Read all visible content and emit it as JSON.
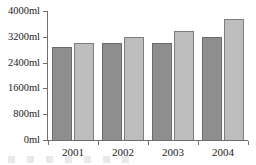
{
  "chart_data": {
    "type": "bar",
    "title": "",
    "subtitle": "",
    "xlabel": "",
    "ylabel": "",
    "categories": [
      "2001",
      "2002",
      "2003",
      "2004"
    ],
    "series": [
      {
        "name": "series-1",
        "color": "#8e8e8e",
        "values": [
          2880,
          3000,
          3000,
          3200
        ]
      },
      {
        "name": "series-2",
        "color": "#bdbdbd",
        "values": [
          3000,
          3190,
          3380,
          3760
        ]
      }
    ],
    "ylim": [
      0,
      4000
    ],
    "yticks": [
      0,
      800,
      1600,
      2400,
      3200,
      4000
    ],
    "ytick_labels": [
      "0ml",
      "800ml",
      "1600ml",
      "2400ml",
      "3200ml",
      "4000ml"
    ],
    "xtick_labels": [
      "2001",
      "2002",
      "2003",
      "2004"
    ],
    "unit": "ml",
    "grid": false,
    "legend": false,
    "legend_position": "none",
    "annotations": []
  },
  "axis": {
    "y_labels": [
      "4000ml",
      "3200ml",
      "2400ml",
      "1600ml",
      "800ml",
      "0ml"
    ],
    "x_labels": [
      "2001",
      "2002",
      "2003",
      "2004"
    ]
  },
  "colors": {
    "series_dark": "#8e8e8e",
    "series_light": "#bdbdbd",
    "axis": "#6f6f6f",
    "text": "#1b1b1b",
    "background": "#ffffff"
  }
}
